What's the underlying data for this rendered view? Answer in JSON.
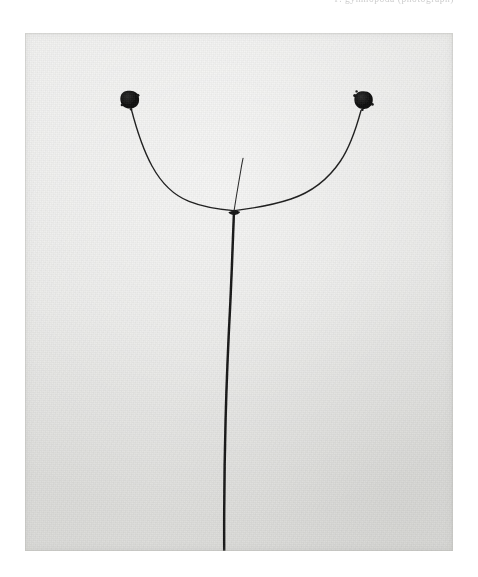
{
  "page": {
    "background_color": "#ffffff",
    "width": 478,
    "height": 577,
    "header_text": "P. gymnopoda (photograph)"
  },
  "plate": {
    "label": "botanical specimen photograph",
    "medium": "black and white photographic print",
    "background_color": "#e7e7e5",
    "ink_color": "#1a1a1a",
    "bounds": {
      "x": 25,
      "y": 33,
      "width": 428,
      "height": 518
    }
  },
  "specimen": {
    "common_description": "slender plant stem with two arching lateral branches each bearing a dark rounded seed head",
    "parts": [
      {
        "name": "main-stem",
        "label": "main stem",
        "color": "#141414"
      },
      {
        "name": "left-branch",
        "label": "left lateral branch",
        "color": "#1d1d1d"
      },
      {
        "name": "right-branch",
        "label": "right lateral branch",
        "color": "#1d1d1d"
      },
      {
        "name": "central-shoot",
        "label": "central shoot",
        "color": "#2a2a2a"
      },
      {
        "name": "left-seed-head",
        "label": "left seed head",
        "color": "#101010"
      },
      {
        "name": "right-seed-head",
        "label": "right seed head",
        "color": "#101010"
      },
      {
        "name": "branch-node",
        "label": "branch node",
        "color": "#121212"
      }
    ],
    "geometry": {
      "node": {
        "x": 209,
        "y": 177
      },
      "stem_base": {
        "x": 199,
        "y": 518
      },
      "left_seed_head": {
        "x": 104,
        "y": 66,
        "r": 8.2
      },
      "right_seed_head": {
        "x": 338,
        "y": 67,
        "r": 8.4
      },
      "central_shoot_tip": {
        "x": 218,
        "y": 125
      }
    }
  }
}
